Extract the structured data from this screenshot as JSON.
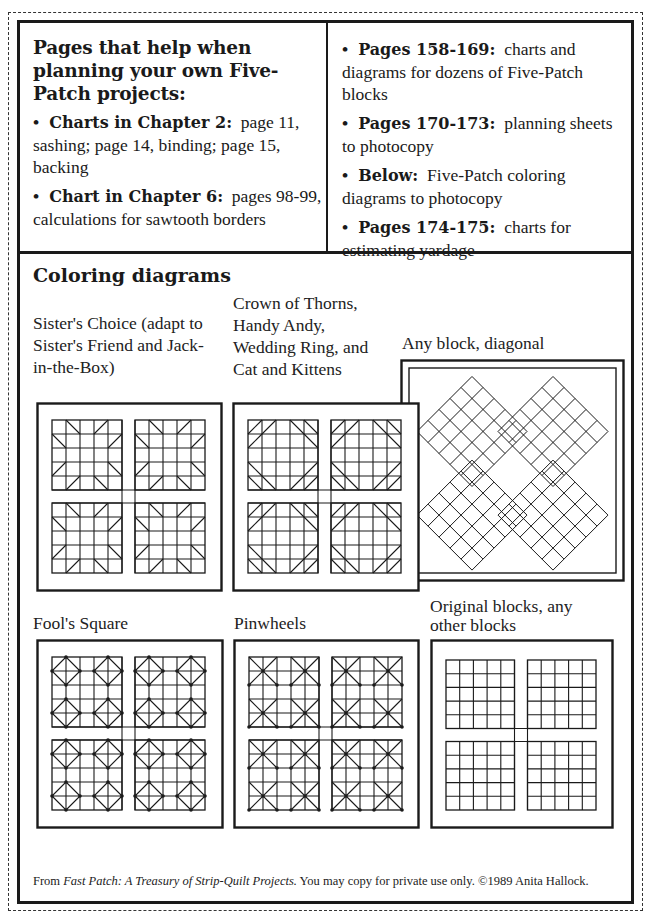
{
  "top_left": {
    "heading": "Pages that help when planning your own Five-Patch projects:",
    "bullets": [
      {
        "bold": "Charts in Chapter 2:",
        "text": "page 11, sashing; page 14, binding; page 15, backing"
      },
      {
        "bold": "Chart in Chapter 6:",
        "text": "pages 98-99, calculations for sawtooth borders"
      }
    ]
  },
  "top_right": {
    "bullets": [
      {
        "bold": "Pages 158-169:",
        "text": "charts and diagrams for dozens of Five-Patch blocks"
      },
      {
        "bold": "Pages 170-173:",
        "text": "planning sheets to photocopy"
      },
      {
        "bold": "Below:",
        "text": "Five-Patch coloring diagrams to photocopy"
      },
      {
        "bold": "Pages 174-175:",
        "text": "charts for estimating yardage"
      }
    ]
  },
  "section_title": "Coloring diagrams",
  "bullet_glyph": "•",
  "diagrams": [
    {
      "id": "sisters-choice",
      "label": "Sister's Choice (adapt to Sister's Friend and Jack-in-the-Box)",
      "pattern": "sisters"
    },
    {
      "id": "crown-of-thorns",
      "label": "Crown of Thorns, Handy Andy, Wedding Ring, and Cat and Kittens",
      "pattern": "crown"
    },
    {
      "id": "any-block-diagonal",
      "label": "Any block, diagonal",
      "pattern": "diagonal"
    },
    {
      "id": "fools-square",
      "label": "Fool's Square",
      "pattern": "fools"
    },
    {
      "id": "pinwheels",
      "label": "Pinwheels",
      "pattern": "pinwheels"
    },
    {
      "id": "original-blocks",
      "label": "Original blocks, any other blocks",
      "pattern": "plain"
    }
  ],
  "footer": {
    "prefix": "From",
    "book_title": "Fast Patch:  A Treasury of Strip-Quilt Projects.",
    "suffix": "You may copy for private use only. ©1989 Anita Hallock."
  },
  "colors": {
    "ink": "#1a1a1a",
    "paper": "#ffffff"
  }
}
